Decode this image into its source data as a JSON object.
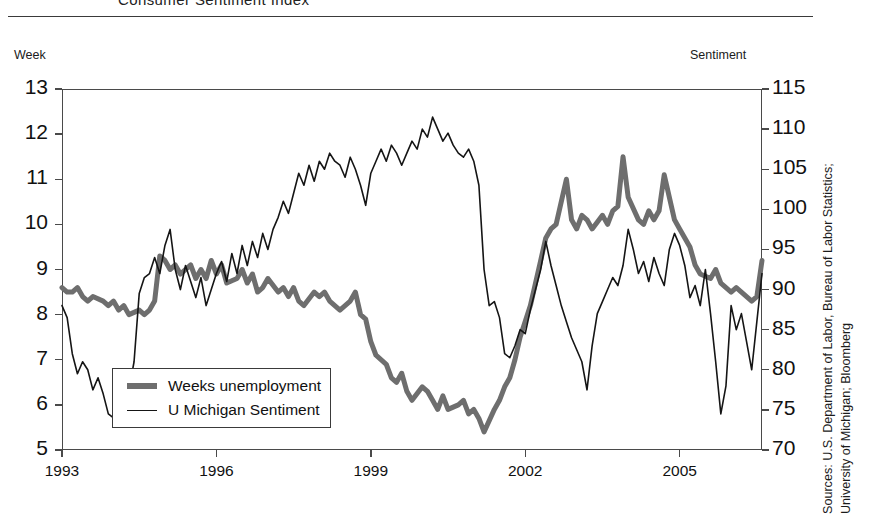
{
  "header": {
    "title": "Consumer Sentiment Index"
  },
  "axes": {
    "left_caption": "Week",
    "right_caption": "Sentiment",
    "left_ticks": [
      "13",
      "12",
      "11",
      "10",
      "9",
      "8",
      "7",
      "6",
      "5"
    ],
    "right_ticks": [
      "115",
      "110",
      "105",
      "100",
      "95",
      "90",
      "85",
      "80",
      "75",
      "70"
    ],
    "x_ticks": [
      "1993",
      "1996",
      "1999",
      "2002",
      "2005"
    ]
  },
  "legend": {
    "items": [
      {
        "label": "Weeks unemployment",
        "style": "thick",
        "color": "#6e6e6e"
      },
      {
        "label": "U Michigan Sentiment",
        "style": "thin",
        "color": "#151515"
      }
    ]
  },
  "footer": {
    "source": "Sources: U.S. Department of Labor, Bureau of Labor Statistics;\nUniversity of Michigan; Bloomberg"
  },
  "colors": {
    "unemployment": "#6e6e6e",
    "sentiment": "#151515",
    "frame": "#4a4a4a",
    "background": "#ffffff"
  },
  "chart_data": {
    "type": "line",
    "title": "Consumer Sentiment Index",
    "xlabel": "",
    "ylabel": "Week",
    "y2label": "Sentiment",
    "xlim": [
      1993.0,
      2006.6
    ],
    "ylim": [
      5,
      13
    ],
    "y2lim": [
      70,
      115
    ],
    "grid": false,
    "legend_position": "inside-lower-left",
    "x_tick_values": [
      1993,
      1996,
      1999,
      2002,
      2005
    ],
    "y_tick_values": [
      5,
      6,
      7,
      8,
      9,
      10,
      11,
      12,
      13
    ],
    "y2_tick_values": [
      70,
      75,
      80,
      85,
      90,
      95,
      100,
      105,
      110,
      115
    ],
    "series": [
      {
        "name": "Weeks unemployment",
        "axis": "left",
        "units": "weeks",
        "color": "#6e6e6e",
        "linewidth": 5,
        "x": [
          1993.0,
          1993.1,
          1993.2,
          1993.3,
          1993.4,
          1993.5,
          1993.6,
          1993.8,
          1993.9,
          1994.0,
          1994.1,
          1994.2,
          1994.3,
          1994.5,
          1994.6,
          1994.7,
          1994.8,
          1994.9,
          1995.0,
          1995.1,
          1995.2,
          1995.3,
          1995.5,
          1995.6,
          1995.7,
          1995.8,
          1995.9,
          1996.0,
          1996.1,
          1996.2,
          1996.4,
          1996.5,
          1996.6,
          1996.7,
          1996.8,
          1996.9,
          1997.0,
          1997.2,
          1997.3,
          1997.4,
          1997.5,
          1997.6,
          1997.7,
          1997.9,
          1998.0,
          1998.1,
          1998.2,
          1998.3,
          1998.4,
          1998.6,
          1998.7,
          1998.8,
          1998.9,
          1999.0,
          1999.1,
          1999.3,
          1999.4,
          1999.5,
          1999.6,
          1999.7,
          1999.8,
          2000.0,
          2000.1,
          2000.2,
          2000.3,
          2000.4,
          2000.5,
          2000.7,
          2000.8,
          2000.9,
          2001.0,
          2001.1,
          2001.2,
          2001.4,
          2001.5,
          2001.6,
          2001.7,
          2001.8,
          2001.9,
          2002.1,
          2002.2,
          2002.3,
          2002.4,
          2002.5,
          2002.6,
          2002.8,
          2002.9,
          2003.0,
          2003.1,
          2003.2,
          2003.3,
          2003.5,
          2003.6,
          2003.7,
          2003.8,
          2003.9,
          2004.0,
          2004.2,
          2004.3,
          2004.4,
          2004.5,
          2004.6,
          2004.7,
          2004.9,
          2005.0,
          2005.1,
          2005.2,
          2005.3,
          2005.4,
          2005.6,
          2005.7,
          2005.8,
          2005.9,
          2006.0,
          2006.1,
          2006.3,
          2006.4,
          2006.5,
          2006.6
        ],
        "y": [
          8.6,
          8.5,
          8.5,
          8.6,
          8.4,
          8.3,
          8.4,
          8.3,
          8.2,
          8.3,
          8.1,
          8.2,
          8.0,
          8.1,
          8.0,
          8.1,
          8.3,
          9.3,
          9.2,
          9.0,
          9.1,
          8.9,
          9.1,
          8.8,
          9.0,
          8.8,
          9.2,
          8.9,
          9.1,
          8.7,
          8.8,
          9.0,
          8.7,
          8.9,
          8.5,
          8.6,
          8.8,
          8.5,
          8.6,
          8.4,
          8.6,
          8.3,
          8.2,
          8.5,
          8.4,
          8.5,
          8.3,
          8.2,
          8.1,
          8.3,
          8.5,
          8.0,
          7.9,
          7.4,
          7.1,
          6.9,
          6.6,
          6.5,
          6.7,
          6.3,
          6.1,
          6.4,
          6.3,
          6.1,
          5.9,
          6.2,
          5.9,
          6.0,
          6.1,
          5.8,
          5.9,
          5.7,
          5.4,
          5.9,
          6.1,
          6.4,
          6.6,
          7.0,
          7.5,
          8.2,
          8.7,
          9.2,
          9.7,
          9.9,
          10.0,
          11.0,
          10.1,
          9.9,
          10.2,
          10.1,
          9.9,
          10.2,
          10.0,
          10.3,
          10.4,
          11.5,
          10.6,
          10.1,
          10.0,
          10.3,
          10.1,
          10.3,
          11.1,
          10.1,
          9.9,
          9.7,
          9.5,
          9.1,
          8.9,
          8.8,
          9.0,
          8.7,
          8.6,
          8.5,
          8.6,
          8.4,
          8.3,
          8.4,
          9.2
        ]
      },
      {
        "name": "U Michigan Sentiment",
        "axis": "right",
        "units": "index",
        "color": "#151515",
        "linewidth": 1.6,
        "x": [
          1993.0,
          1993.1,
          1993.2,
          1993.3,
          1993.4,
          1993.5,
          1993.6,
          1993.7,
          1993.8,
          1993.9,
          1994.0,
          1994.1,
          1994.2,
          1994.3,
          1994.4,
          1994.5,
          1994.6,
          1994.7,
          1994.8,
          1994.9,
          1995.0,
          1995.1,
          1995.2,
          1995.3,
          1995.4,
          1995.5,
          1995.6,
          1995.7,
          1995.8,
          1995.9,
          1996.0,
          1996.1,
          1996.2,
          1996.3,
          1996.4,
          1996.5,
          1996.6,
          1996.7,
          1996.8,
          1996.9,
          1997.0,
          1997.1,
          1997.2,
          1997.3,
          1997.4,
          1997.5,
          1997.6,
          1997.7,
          1997.8,
          1997.9,
          1998.0,
          1998.1,
          1998.2,
          1998.3,
          1998.4,
          1998.5,
          1998.6,
          1998.7,
          1998.8,
          1998.9,
          1999.0,
          1999.1,
          1999.2,
          1999.3,
          1999.4,
          1999.5,
          1999.6,
          1999.7,
          1999.8,
          1999.9,
          2000.0,
          2000.1,
          2000.2,
          2000.3,
          2000.4,
          2000.5,
          2000.6,
          2000.7,
          2000.8,
          2000.9,
          2001.0,
          2001.1,
          2001.2,
          2001.3,
          2001.4,
          2001.5,
          2001.6,
          2001.7,
          2001.8,
          2001.9,
          2002.0,
          2002.1,
          2002.2,
          2002.3,
          2002.4,
          2002.5,
          2002.6,
          2002.7,
          2002.8,
          2002.9,
          2003.0,
          2003.1,
          2003.2,
          2003.3,
          2003.4,
          2003.5,
          2003.6,
          2003.7,
          2003.8,
          2003.9,
          2004.0,
          2004.1,
          2004.2,
          2004.3,
          2004.4,
          2004.5,
          2004.6,
          2004.7,
          2004.8,
          2004.9,
          2005.0,
          2005.1,
          2005.2,
          2005.3,
          2005.4,
          2005.5,
          2005.6,
          2005.7,
          2005.8,
          2005.9,
          2006.0,
          2006.1,
          2006.2,
          2006.3,
          2006.4,
          2006.5,
          2006.6
        ],
        "y": [
          88.0,
          86.5,
          82.0,
          79.5,
          81.0,
          80.0,
          77.5,
          79.0,
          77.0,
          74.5,
          74.0,
          78.5,
          80.0,
          77.5,
          81.0,
          89.5,
          91.5,
          92.0,
          94.0,
          92.0,
          95.5,
          97.5,
          92.5,
          90.0,
          93.0,
          91.0,
          89.0,
          91.5,
          88.0,
          90.0,
          92.0,
          93.5,
          91.0,
          94.5,
          92.0,
          95.5,
          93.0,
          96.0,
          94.0,
          97.0,
          95.0,
          97.5,
          99.0,
          101.0,
          99.5,
          102.0,
          104.5,
          103.0,
          105.5,
          103.5,
          106.0,
          105.0,
          107.0,
          106.0,
          105.5,
          104.0,
          106.5,
          105.0,
          103.0,
          100.5,
          104.5,
          106.0,
          107.5,
          106.0,
          108.0,
          107.0,
          105.5,
          107.0,
          108.5,
          107.5,
          110.0,
          109.0,
          111.5,
          110.0,
          108.5,
          109.5,
          108.0,
          107.0,
          106.5,
          107.5,
          106.0,
          103.0,
          92.5,
          88.0,
          88.5,
          86.5,
          82.0,
          81.5,
          83.0,
          85.0,
          84.5,
          87.5,
          90.0,
          92.5,
          96.0,
          93.0,
          90.5,
          88.0,
          86.0,
          84.0,
          82.5,
          81.0,
          77.5,
          83.0,
          87.0,
          88.5,
          90.0,
          91.5,
          90.5,
          93.0,
          97.5,
          95.0,
          92.0,
          93.5,
          91.0,
          94.0,
          92.0,
          90.5,
          95.0,
          97.0,
          95.5,
          93.0,
          89.0,
          90.5,
          88.0,
          92.5,
          87.0,
          81.0,
          74.5,
          78.0,
          88.0,
          85.0,
          87.0,
          83.5,
          80.0,
          86.0,
          92.0
        ]
      }
    ]
  }
}
